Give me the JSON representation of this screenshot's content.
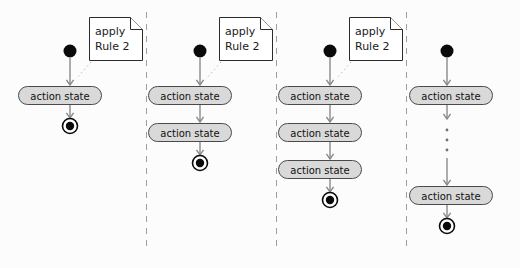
{
  "diagram": {
    "background_color": "#fcfcfc",
    "width": 520,
    "height": 268,
    "state_fill_color": "#d9d9d9",
    "state_stroke_color": "#4a4a4a",
    "edge_color": "#8a8a8a",
    "divider_color": "#9e9e9e",
    "note_text_line1": "apply",
    "note_text_line2": "Rule 2",
    "action_state_label": "action state",
    "ellipsis_glyph": "vertical-ellipsis",
    "panels": [
      {
        "id": "panel-1",
        "index": 1,
        "action_state_count": 1,
        "has_note": true,
        "has_ellipsis": false,
        "note_line1": "apply",
        "note_line2": "Rule 2",
        "states": [
          "action state"
        ]
      },
      {
        "id": "panel-2",
        "index": 2,
        "action_state_count": 2,
        "has_note": true,
        "has_ellipsis": false,
        "note_line1": "apply",
        "note_line2": "Rule 2",
        "states": [
          "action state",
          "action state"
        ]
      },
      {
        "id": "panel-3",
        "index": 3,
        "action_state_count": 3,
        "has_note": true,
        "has_ellipsis": false,
        "note_line1": "apply",
        "note_line2": "Rule 2",
        "states": [
          "action state",
          "action state",
          "action state"
        ]
      },
      {
        "id": "panel-4",
        "index": 4,
        "action_state_count": 2,
        "has_note": false,
        "has_ellipsis": true,
        "note_line1": "",
        "note_line2": "",
        "states": [
          "action state",
          "action state"
        ]
      }
    ],
    "dividers": [
      146,
      276,
      406
    ]
  }
}
